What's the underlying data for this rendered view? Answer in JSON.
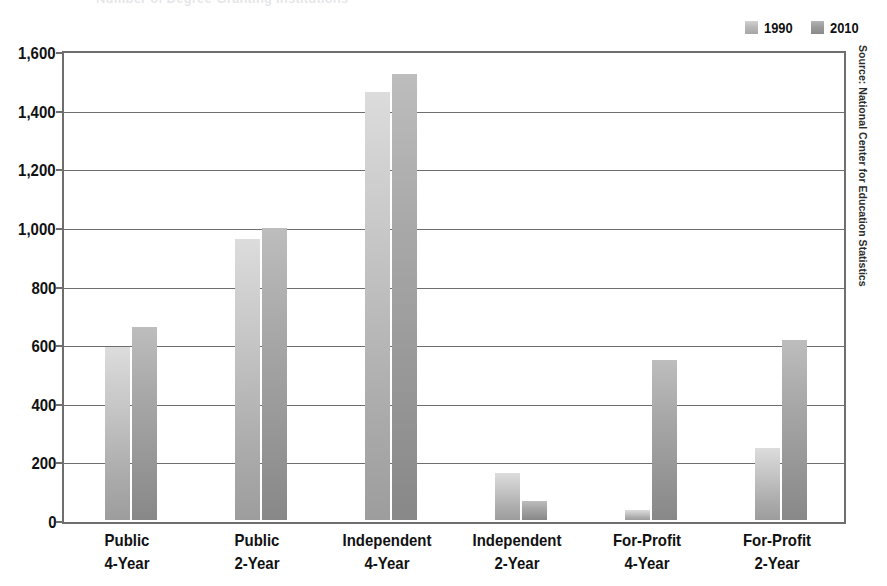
{
  "title_ghost": "Number of Degree-Granting Institutions",
  "legend": {
    "position": "top-right",
    "items": [
      {
        "label": "1990",
        "color": "#c6c6c6"
      },
      {
        "label": "2010",
        "color": "#a0a0a0"
      }
    ]
  },
  "source_note": "Source: National Center for Education Statistics",
  "axis": {
    "y_ticks": [
      "1,600",
      "1,400",
      "1,200",
      "1,000",
      "800",
      "600",
      "400",
      "200",
      "0"
    ],
    "x_categories": [
      {
        "line1": "Public",
        "line2": "4-Year"
      },
      {
        "line1": "Public",
        "line2": "2-Year"
      },
      {
        "line1": "Independent",
        "line2": "4-Year"
      },
      {
        "line1": "Independent",
        "line2": "2-Year"
      },
      {
        "line1": "For-Profit",
        "line2": "4-Year"
      },
      {
        "line1": "For-Profit",
        "line2": "2-Year"
      }
    ]
  },
  "chart_data": {
    "type": "bar",
    "title": "",
    "xlabel": "",
    "ylabel": "",
    "ylim": [
      0,
      1600
    ],
    "ytick_step": 200,
    "grid": true,
    "legend_position": "top-right",
    "categories": [
      "Public 4-Year",
      "Public 2-Year",
      "Independent 4-Year",
      "Independent 2-Year",
      "For-Profit 4-Year",
      "For-Profit 2-Year"
    ],
    "series": [
      {
        "name": "1990",
        "color": "#c6c6c6",
        "values": [
          590,
          960,
          1460,
          160,
          35,
          245
        ]
      },
      {
        "name": "2010",
        "color": "#a0a0a0",
        "values": [
          660,
          995,
          1520,
          65,
          545,
          615
        ]
      }
    ],
    "source": "Source: National Center for Education Statistics"
  }
}
